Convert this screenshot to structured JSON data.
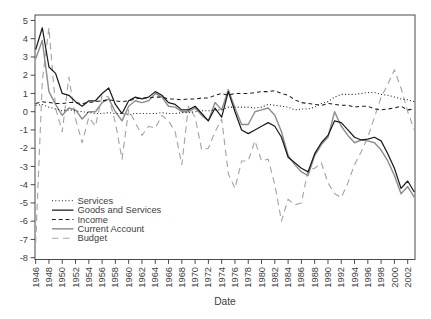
{
  "chart_data": {
    "type": "line",
    "title": "",
    "xlabel": "Date",
    "ylabel": "",
    "grid": false,
    "legend_position": "inside-bottom-left",
    "xlim": [
      1945.9,
      2003.1
    ],
    "ylim": [
      -8.1,
      5.3
    ],
    "x_ticks": [
      1946,
      1948,
      1950,
      1952,
      1954,
      1956,
      1958,
      1960,
      1962,
      1964,
      1966,
      1968,
      1970,
      1972,
      1974,
      1976,
      1978,
      1980,
      1982,
      1984,
      1986,
      1988,
      1990,
      1992,
      1994,
      1996,
      1998,
      2000,
      2002
    ],
    "y_ticks": [
      -8,
      -7,
      -6,
      -5,
      -4,
      -3,
      -2,
      -1,
      0,
      1,
      2,
      3,
      4,
      5
    ],
    "x": [
      1946,
      1947,
      1948,
      1949,
      1950,
      1951,
      1952,
      1953,
      1954,
      1955,
      1956,
      1957,
      1958,
      1959,
      1960,
      1961,
      1962,
      1963,
      1964,
      1965,
      1966,
      1967,
      1968,
      1969,
      1970,
      1971,
      1972,
      1973,
      1974,
      1975,
      1976,
      1977,
      1978,
      1979,
      1980,
      1981,
      1982,
      1983,
      1984,
      1985,
      1986,
      1987,
      1988,
      1989,
      1990,
      1991,
      1992,
      1993,
      1994,
      1995,
      1996,
      1997,
      1998,
      1999,
      2000,
      2001,
      2002,
      2003
    ],
    "series": [
      {
        "name": "Services",
        "color": "#1c1c1c",
        "style": "dotted",
        "values": [
          0.35,
          0.4,
          0.25,
          0.15,
          0.05,
          0.1,
          0.05,
          0.0,
          -0.05,
          -0.1,
          -0.1,
          -0.05,
          -0.1,
          -0.1,
          -0.15,
          -0.1,
          -0.1,
          -0.1,
          -0.1,
          -0.05,
          -0.1,
          -0.1,
          -0.05,
          -0.05,
          0.0,
          0.05,
          0.05,
          0.1,
          0.1,
          0.25,
          0.25,
          0.25,
          0.25,
          0.2,
          0.25,
          0.4,
          0.35,
          0.3,
          0.25,
          0.1,
          0.15,
          0.15,
          0.25,
          0.45,
          0.55,
          0.8,
          0.95,
          0.95,
          0.95,
          1.0,
          1.05,
          1.05,
          0.95,
          0.9,
          0.8,
          0.7,
          0.65,
          0.55
        ]
      },
      {
        "name": "Goods and Services",
        "color": "#1c1c1c",
        "style": "solid",
        "values": [
          3.4,
          4.6,
          2.45,
          2.1,
          1.0,
          0.9,
          0.55,
          0.3,
          0.6,
          0.6,
          1.0,
          1.3,
          0.4,
          -0.1,
          0.6,
          0.8,
          0.7,
          0.8,
          1.1,
          0.9,
          0.5,
          0.4,
          0.1,
          0.1,
          0.3,
          -0.1,
          -0.5,
          0.2,
          -0.3,
          1.1,
          0.0,
          -1.0,
          -1.2,
          -1.0,
          -0.8,
          -0.6,
          -0.8,
          -1.4,
          -2.5,
          -2.8,
          -3.1,
          -3.3,
          -2.3,
          -1.7,
          -1.3,
          -0.5,
          -0.6,
          -1.0,
          -1.4,
          -1.55,
          -1.5,
          -1.4,
          -1.6,
          -2.3,
          -3.1,
          -4.2,
          -3.8,
          -4.4
        ]
      },
      {
        "name": "Income",
        "color": "#1c1c1c",
        "style": "dashed",
        "values": [
          0.45,
          0.55,
          0.5,
          0.45,
          0.45,
          0.5,
          0.5,
          0.45,
          0.5,
          0.55,
          0.6,
          0.65,
          0.6,
          0.55,
          0.6,
          0.7,
          0.75,
          0.75,
          0.8,
          0.8,
          0.7,
          0.7,
          0.65,
          0.7,
          0.7,
          0.75,
          0.75,
          0.9,
          1.0,
          0.9,
          1.0,
          1.0,
          1.0,
          1.05,
          1.1,
          1.1,
          1.15,
          1.0,
          0.9,
          0.65,
          0.5,
          0.45,
          0.4,
          0.35,
          0.45,
          0.4,
          0.35,
          0.35,
          0.25,
          0.3,
          0.3,
          0.15,
          0.1,
          0.15,
          0.2,
          0.3,
          0.1,
          0.15
        ]
      },
      {
        "name": "Current Account",
        "color": "#8e8e8e",
        "style": "solid",
        "values": [
          2.9,
          3.9,
          1.1,
          0.4,
          -0.2,
          0.2,
          0.1,
          -0.4,
          0.0,
          0.0,
          0.5,
          0.7,
          0.0,
          -0.5,
          0.3,
          0.6,
          0.5,
          0.6,
          1.0,
          0.8,
          0.3,
          0.25,
          0.0,
          0.0,
          0.2,
          -0.2,
          -0.5,
          0.5,
          0.1,
          1.2,
          0.2,
          -0.7,
          -0.7,
          0.0,
          0.1,
          0.2,
          -0.2,
          -1.1,
          -2.4,
          -2.9,
          -3.3,
          -3.5,
          -2.4,
          -1.8,
          -1.4,
          0.0,
          -0.8,
          -1.3,
          -1.7,
          -1.55,
          -1.6,
          -1.7,
          -2.1,
          -2.7,
          -3.5,
          -4.5,
          -4.1,
          -4.7
        ]
      },
      {
        "name": "Budget",
        "color": "#a6a6a6",
        "style": "longdash",
        "values": [
          -7.2,
          1.7,
          4.6,
          0.2,
          -1.1,
          1.9,
          -0.4,
          -1.7,
          -0.3,
          -0.8,
          0.9,
          0.8,
          -0.6,
          -2.6,
          0.1,
          -0.6,
          -1.3,
          -0.8,
          -0.9,
          -0.2,
          -0.5,
          -1.1,
          -2.9,
          0.3,
          -0.3,
          -2.1,
          -2.0,
          -1.1,
          -0.4,
          -3.4,
          -4.2,
          -2.7,
          -2.7,
          -1.6,
          -2.7,
          -2.6,
          -4.0,
          -6.0,
          -4.8,
          -5.1,
          -5.0,
          -3.2,
          -3.1,
          -2.8,
          -3.9,
          -4.5,
          -4.7,
          -3.9,
          -2.9,
          -2.2,
          -1.4,
          -0.3,
          0.8,
          1.5,
          2.3,
          1.3,
          0.0,
          -1.0
        ]
      }
    ],
    "axis_color": "#4a4a4a",
    "label_color": "#3d3d3d"
  }
}
